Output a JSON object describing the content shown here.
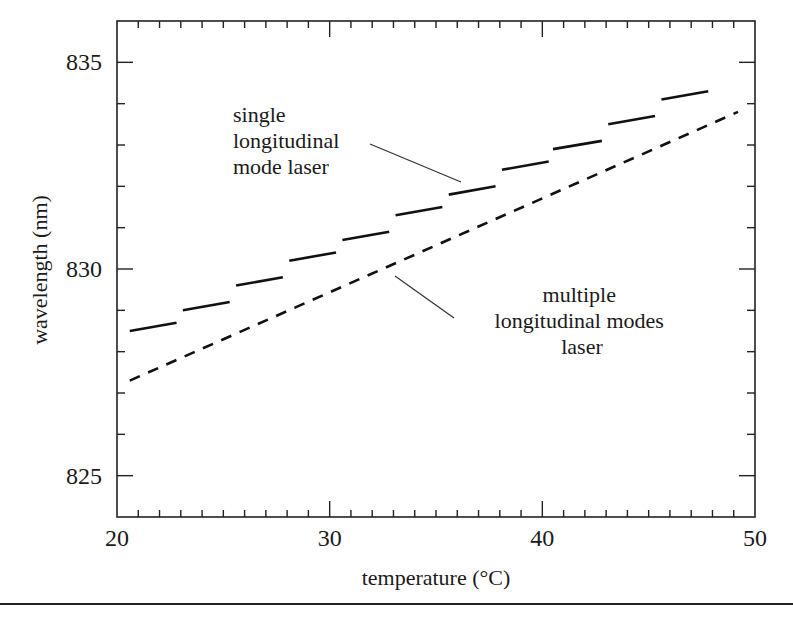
{
  "chart_data": {
    "type": "line",
    "title": "",
    "xlabel": "temperature (°C)",
    "ylabel": "wavelength (nm)",
    "xlim": [
      20,
      50
    ],
    "ylim": [
      824,
      836
    ],
    "x_major_ticks": [
      20,
      30,
      40,
      50
    ],
    "x_tick_labels": [
      "20",
      "30",
      "40",
      "50"
    ],
    "x_minor_step": 1,
    "y_major_ticks": [
      825,
      830,
      835
    ],
    "y_tick_labels": [
      "825",
      "830",
      "835"
    ],
    "y_minor_step": 1,
    "grid": false,
    "legend": null,
    "series": [
      {
        "name": "single longitudinal mode laser",
        "style": "long-dash (mode hops, stepwise)",
        "segments": [
          {
            "x": [
              20.6,
              22.8
            ],
            "y": [
              828.5,
              828.7
            ]
          },
          {
            "x": [
              23.1,
              25.3
            ],
            "y": [
              829.0,
              829.2
            ]
          },
          {
            "x": [
              25.6,
              27.8
            ],
            "y": [
              829.6,
              829.8
            ]
          },
          {
            "x": [
              28.1,
              30.3
            ],
            "y": [
              830.2,
              830.4
            ]
          },
          {
            "x": [
              30.6,
              32.8
            ],
            "y": [
              830.7,
              830.9
            ]
          },
          {
            "x": [
              33.1,
              35.3
            ],
            "y": [
              831.3,
              831.5
            ]
          },
          {
            "x": [
              35.6,
              37.8
            ],
            "y": [
              831.8,
              832.0
            ]
          },
          {
            "x": [
              38.1,
              40.3
            ],
            "y": [
              832.4,
              832.6
            ]
          },
          {
            "x": [
              40.5,
              42.8
            ],
            "y": [
              832.9,
              833.1
            ]
          },
          {
            "x": [
              43.1,
              45.3
            ],
            "y": [
              833.5,
              833.7
            ]
          },
          {
            "x": [
              45.6,
              47.8
            ],
            "y": [
              834.1,
              834.3
            ]
          }
        ]
      },
      {
        "name": "multiple longitudinal modes laser",
        "style": "short-dash",
        "x": [
          20.6,
          49.2
        ],
        "y": [
          827.3,
          833.8
        ]
      }
    ],
    "annotations": [
      {
        "lines": [
          "single",
          "longitudinal",
          "mode laser"
        ],
        "points_to": "single longitudinal mode laser"
      },
      {
        "lines": [
          "multiple",
          "longitudinal modes",
          "laser"
        ],
        "points_to": "multiple longitudinal modes laser"
      }
    ]
  }
}
